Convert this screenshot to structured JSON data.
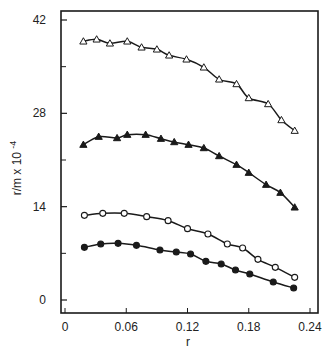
{
  "chart_data": {
    "type": "line",
    "title": "",
    "xlabel": "r",
    "ylabel": "r/m x 10",
    "ylabel_exponent": "-4",
    "xlim": [
      0,
      0.24
    ],
    "ylim": [
      0,
      42
    ],
    "x_ticks": [
      0,
      0.06,
      0.12,
      0.18,
      0.24
    ],
    "x_tick_labels": [
      "0",
      "0.06",
      "0.12",
      "0.18",
      "0.24"
    ],
    "y_ticks": [
      0,
      14,
      28,
      42
    ],
    "y_tick_labels": [
      "0",
      "14",
      "28",
      "42"
    ],
    "y_minor_ticks": [
      7,
      21,
      35
    ],
    "grid": false,
    "legend": null,
    "series": [
      {
        "name": "open-triangles",
        "marker": "triangle-open",
        "x": [
          0.018,
          0.031,
          0.044,
          0.061,
          0.075,
          0.09,
          0.102,
          0.119,
          0.136,
          0.151,
          0.168,
          0.18,
          0.199,
          0.212,
          0.225
        ],
        "y": [
          38.8,
          39.1,
          38.5,
          38.8,
          37.9,
          37.6,
          36.7,
          36.1,
          34.9,
          33.1,
          32.4,
          30.3,
          29.4,
          27.0,
          25.4
        ]
      },
      {
        "name": "filled-triangles",
        "marker": "triangle-filled",
        "x": [
          0.018,
          0.033,
          0.051,
          0.061,
          0.079,
          0.094,
          0.107,
          0.121,
          0.136,
          0.151,
          0.168,
          0.18,
          0.197,
          0.211,
          0.225
        ],
        "y": [
          23.3,
          24.5,
          24.3,
          24.8,
          24.8,
          24.2,
          23.7,
          23.3,
          22.8,
          21.6,
          20.3,
          19.1,
          17.3,
          16.1,
          13.9
        ]
      },
      {
        "name": "open-circles",
        "marker": "circle-open",
        "x": [
          0.019,
          0.037,
          0.058,
          0.08,
          0.101,
          0.12,
          0.14,
          0.159,
          0.174,
          0.189,
          0.206,
          0.225
        ],
        "y": [
          12.7,
          13.0,
          13.0,
          12.5,
          11.9,
          10.7,
          9.9,
          8.4,
          7.8,
          6.1,
          4.9,
          3.4
        ]
      },
      {
        "name": "filled-circles",
        "marker": "circle-filled",
        "x": [
          0.019,
          0.035,
          0.052,
          0.07,
          0.093,
          0.109,
          0.123,
          0.138,
          0.153,
          0.167,
          0.181,
          0.204,
          0.224
        ],
        "y": [
          7.9,
          8.4,
          8.5,
          8.2,
          7.5,
          7.2,
          6.9,
          5.8,
          5.4,
          4.5,
          3.9,
          2.7,
          1.8
        ]
      }
    ]
  },
  "colors": {
    "ink": "#1a1a1a",
    "background": "#ffffff"
  }
}
